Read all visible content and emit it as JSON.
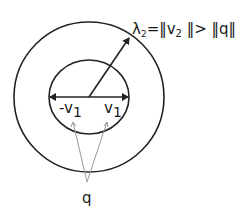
{
  "diagram": {
    "title_label": {
      "lambda": "λ",
      "lambda_sub": "2",
      "rest_a": "=‖v",
      "v_sub": "2",
      "rest_b": " ‖> ‖q‖"
    },
    "inner_labels": {
      "neg_v": "-v",
      "neg_v_sub": "1",
      "pos_v": "v",
      "pos_v_sub": "1"
    },
    "q_label": "q",
    "colors": {
      "stroke": "#222222",
      "pointer": "#9a9a9a",
      "background": "#ffffff"
    }
  }
}
